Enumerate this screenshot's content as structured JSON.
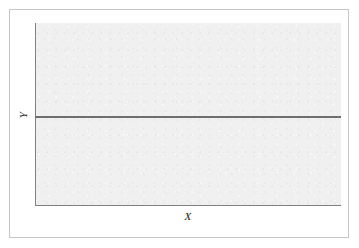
{
  "figure": {
    "frame_border_color": "#c6c6c6",
    "page_background": "#ffffff"
  },
  "chart_data": {
    "type": "line",
    "title": "",
    "subtitle": "",
    "xlabel": "X",
    "ylabel": "Y",
    "x": [
      0,
      1
    ],
    "series": [
      {
        "name": "",
        "values": [
          0.49,
          0.49
        ],
        "color": "#6e6e6e"
      }
    ],
    "xlim": [
      0,
      1
    ],
    "ylim": [
      0,
      1
    ],
    "xticks": [],
    "yticks": [],
    "xticklabels": [],
    "yticklabels": [],
    "grid": false,
    "legend": false,
    "legend_position": "none",
    "panel_background": "#f0f0f0",
    "axis_color": "#808080",
    "annotations": []
  },
  "axes": {
    "x_label": "X",
    "y_label": "Y"
  }
}
